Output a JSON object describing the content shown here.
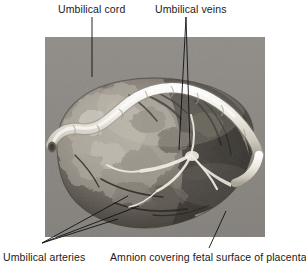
{
  "figure": {
    "type": "anatomical-photograph",
    "background_color": "#ffffff",
    "photo": {
      "name": "placenta-photo",
      "x": 45,
      "y": 37,
      "width": 220,
      "height": 200,
      "backdrop_color": "#8a8a8a",
      "tissue_color_light": "#b9b4ad",
      "tissue_color_mid": "#6d6862",
      "tissue_color_dark": "#2e2b28",
      "cord_color": "#efece2",
      "vessel_color": "#f2efe6"
    }
  },
  "labels": {
    "umbilical_cord": "Umbilical cord",
    "umbilical_veins": "Umbilical veins",
    "umbilical_arteries": "Umbilical arteries",
    "amnion": "Amnion covering fetal surface of placenta"
  },
  "leader_lines": {
    "color": "#111111",
    "width": 0.9,
    "umbilical_cord": [
      {
        "x1": 92,
        "y1": 17,
        "x2": 92,
        "y2": 77
      }
    ],
    "umbilical_veins": [
      {
        "x1": 186,
        "y1": 17,
        "x2": 179,
        "y2": 150
      },
      {
        "x1": 186,
        "y1": 17,
        "x2": 190,
        "y2": 147
      }
    ],
    "umbilical_arteries": [
      {
        "x1": 42,
        "y1": 243,
        "x2": 128,
        "y2": 196
      },
      {
        "x1": 42,
        "y1": 243,
        "x2": 139,
        "y2": 206
      },
      {
        "x1": 42,
        "y1": 243,
        "x2": 118,
        "y2": 219
      }
    ],
    "amnion": [
      {
        "x1": 209,
        "y1": 248,
        "x2": 226,
        "y2": 211
      }
    ]
  }
}
